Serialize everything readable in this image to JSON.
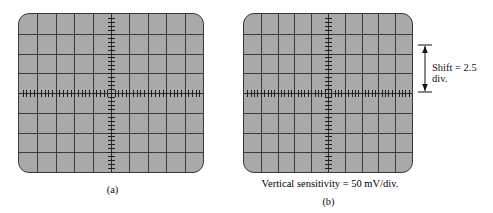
{
  "figure": {
    "type": "oscilloscope-graticule-pair",
    "background_color": "#ffffff"
  },
  "panels": [
    {
      "id": "a",
      "caption": "(a)",
      "screen": {
        "name": "oscilloscope-screen-a",
        "background_color": "#a9a9a9",
        "border_color": "#3a3a3a",
        "divisions_horizontal": 10,
        "divisions_vertical": 8,
        "minor_ticks_per_division": 5,
        "trace_position_divisions_from_center": 0,
        "trace_description": "horizontal tick-marked center axis at 0 divisions (no shift)"
      }
    },
    {
      "id": "b",
      "caption": "(b)",
      "screen": {
        "name": "oscilloscope-screen-b",
        "background_color": "#a9a9a9",
        "border_color": "#3a3a3a",
        "divisions_horizontal": 10,
        "divisions_vertical": 8,
        "minor_ticks_per_division": 5,
        "trace_position_divisions_from_center": 0,
        "trace_description": "horizontal tick-marked axis shifted down relative to reference gridline"
      },
      "annotations": {
        "shift_label": "Shift = 2.5 div.",
        "shift_value": 2.5,
        "shift_unit": "div.",
        "arrow": "double-headed-vertical-arrow",
        "vertical_sensitivity_label": "Vertical sensitivity = 50 mV/div.",
        "vertical_sensitivity_value": 50,
        "vertical_sensitivity_unit": "mV/div."
      }
    }
  ],
  "colors": {
    "screen_fill": "#a9a9a9",
    "grid_line": "#3c3c3c",
    "axis_line": "#2b2b2b",
    "tick": "#1d1d1d",
    "text": "#111111"
  }
}
